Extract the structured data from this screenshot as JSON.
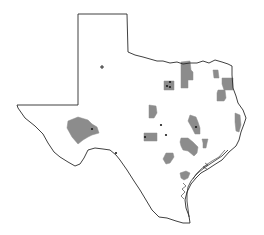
{
  "map": {
    "subject": "Texas",
    "colors": {
      "background": "#ffffff",
      "outline": "#2a2a2a",
      "region_fill": "#8c8c8c",
      "marker": "#1a1a1a"
    },
    "outline_points": "78,14 127,14 128,52 135,55 143,57 150,59 157,61 163,61 170,63 177,62 183,64 190,63 197,63 203,61 209,63 215,60 222,62 228,64 232,66 232,75 233,88 236,96 238,103 243,110 246,118 244,124 241,132 239,140 236,146 229,152 222,160 214,165 208,169 201,173 196,178 191,184 187,192 185,200 186,208 189,216 190,223 183,223 176,221 167,218 159,217 152,210 146,200 140,190 134,181 127,170 120,160 116,155 110,150 103,149 95,148 88,150 84,158 80,164 75,166 68,162 60,157 54,152 48,143 43,134 35,126 25,118 18,108 17,105 78,105 78,14",
    "regions": [
      {
        "name": "north-central-tall",
        "points": "181,62 190,61 191,70 193,72 193,80 188,80 188,88 181,88 181,75 181,62"
      },
      {
        "name": "north-central-square",
        "points": "164,81 174,81 174,90 164,90"
      },
      {
        "name": "northeast-small",
        "points": "213,70 218,70 219,78 214,78"
      },
      {
        "name": "northeast-large",
        "points": "222,78 233,78 233,90 224,90 222,84"
      },
      {
        "name": "northeast-mid",
        "points": "218,90 225,90 226,98 224,101 217,101 217,93"
      },
      {
        "name": "central-west",
        "points": "149,105 156,106 157,113 154,118 149,118"
      },
      {
        "name": "east-elongated",
        "points": "235,113 240,115 241,125 239,132 236,131 235,122"
      },
      {
        "name": "west-large",
        "points": "68,121 78,117 88,120 92,124 97,127 99,133 92,135 88,137 83,140 78,144 72,137 67,128"
      },
      {
        "name": "central-east-pointed",
        "points": "190,115 196,117 198,122 200,128 200,134 195,134 192,128 188,121"
      },
      {
        "name": "central-rect",
        "points": "144,133 157,133 157,141 144,141"
      },
      {
        "name": "central-east-large",
        "points": "181,138 188,138 193,142 198,147 197,153 194,156 188,151 183,150 181,146 180,142"
      },
      {
        "name": "east-small-T",
        "points": "202,139 208,139 207,143 206,148 203,148 203,143"
      },
      {
        "name": "south-central",
        "points": "166,153 173,153 174,157 170,163 166,164 163,159"
      },
      {
        "name": "coastal-bend",
        "points": "180,173 186,171 190,173 188,178 184,180 181,178"
      }
    ],
    "markers": [
      {
        "type": "plus",
        "x": 102,
        "y": 67
      },
      {
        "type": "dot",
        "x": 170,
        "y": 82
      },
      {
        "type": "dot",
        "x": 167,
        "y": 86
      },
      {
        "type": "dot",
        "x": 170,
        "y": 87
      },
      {
        "type": "dot",
        "x": 92,
        "y": 129
      },
      {
        "type": "dot",
        "x": 161,
        "y": 125
      },
      {
        "type": "dot",
        "x": 145,
        "y": 137
      },
      {
        "type": "dot",
        "x": 166,
        "y": 135
      },
      {
        "type": "dot",
        "x": 196,
        "y": 127
      },
      {
        "type": "dot",
        "x": 116,
        "y": 153
      }
    ]
  }
}
